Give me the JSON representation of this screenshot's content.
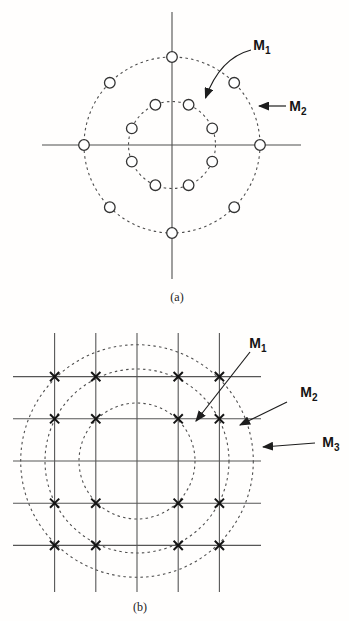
{
  "colors": {
    "line": "#4f4f4f",
    "grid": "#565656",
    "arrow": "#1d1d1d",
    "marker_stroke": "#333333",
    "marker_fill": "#ffffff",
    "x_marker": "#141414",
    "text": "#151515"
  },
  "panel_a": {
    "caption": "(a)",
    "annotations": [
      {
        "id": "M1",
        "main": "M",
        "sub": "1"
      },
      {
        "id": "M2",
        "main": "M",
        "sub": "2"
      }
    ],
    "constellation": {
      "type": "concentric-circular-psk",
      "marker": "open-circle",
      "center": {
        "x": 172,
        "y": 145
      },
      "rings": [
        {
          "label": "M1",
          "points": 8,
          "radius": 43.5,
          "offset_deg": 22.5
        },
        {
          "label": "M2",
          "points": 8,
          "radius": 88,
          "offset_deg": 0
        }
      ]
    }
  },
  "panel_b": {
    "caption": "(b)",
    "annotations": [
      {
        "id": "M1",
        "main": "M",
        "sub": "1"
      },
      {
        "id": "M2",
        "main": "M",
        "sub": "2"
      },
      {
        "id": "M3",
        "main": "M",
        "sub": "3"
      }
    ],
    "constellation": {
      "type": "square-grid-qam-16",
      "marker": "x-cross",
      "center": {
        "x": 137,
        "y": 461
      },
      "unit": {
        "x": 41.2,
        "y": 42.2
      },
      "grid_steps": [
        -2,
        -1,
        1,
        2
      ],
      "rings": [
        {
          "label": "M1",
          "radius": 58
        },
        {
          "label": "M2",
          "radius": 92
        },
        {
          "label": "M3",
          "radius": 116.3
        }
      ]
    }
  }
}
